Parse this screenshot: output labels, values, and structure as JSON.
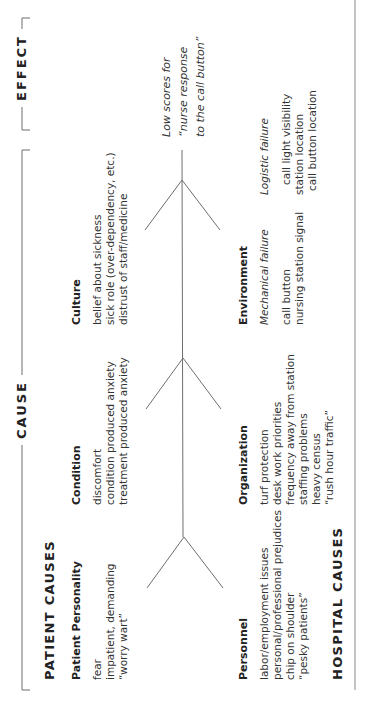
{
  "sections": {
    "cause": "CAUSE",
    "effect": "EFFECT"
  },
  "groups": {
    "patient": "PATIENT CAUSES",
    "hospital": "HOSPITAL CAUSES"
  },
  "effect": {
    "lines": [
      "Low scores for",
      "“nurse response",
      "to the call button”"
    ]
  },
  "categories": {
    "patient_personality": {
      "title": "Patient Personality",
      "items": [
        "fear",
        "impatient, demanding",
        "“worry wart”"
      ]
    },
    "condition": {
      "title": "Condition",
      "items": [
        "discomfort",
        "condition produced anxiety",
        "treatment produced anxiety"
      ]
    },
    "culture": {
      "title": "Culture",
      "items": [
        "belief about sickness",
        "sick role (over-dependency, etc.)",
        "distrust of staff/medicine"
      ]
    },
    "personnel": {
      "title": "Personnel",
      "items": [
        "labor/employment issues",
        "personal/professional prejudices",
        "chip on shoulder",
        "“pesky patients”"
      ]
    },
    "organization": {
      "title": "Organization",
      "items": [
        "turf protection",
        "desk work priorities",
        "frequency away from station",
        "staffing problems",
        "heavy census",
        "“rush hour traffic”"
      ]
    },
    "environment": {
      "title": "Environment",
      "mechanical": {
        "label": "Mechanical failure",
        "items": [
          "call button",
          "nursing station signal"
        ]
      },
      "logistic": {
        "label": "Logistic failure",
        "items": [
          "call light visibility",
          "station location",
          "call button location"
        ]
      }
    }
  },
  "colors": {
    "line": "#6e6e6e",
    "text": "#2a2a2a",
    "background": "#ffffff"
  }
}
